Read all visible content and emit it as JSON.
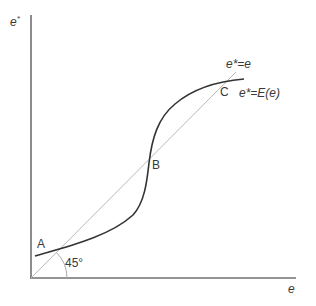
{
  "diagram": {
    "axes": {
      "y_label": "e*",
      "x_label": "e"
    },
    "lines": {
      "forty_five_label": "e*=e",
      "curve_label": "e*=E(e)"
    },
    "points": {
      "a": "A",
      "b": "B",
      "c": "C"
    },
    "angle_label": "45°",
    "colors": {
      "axis": "#707070",
      "curve": "#333333",
      "diagonal": "#b8b8b8",
      "text": "#3a3a3a"
    }
  }
}
